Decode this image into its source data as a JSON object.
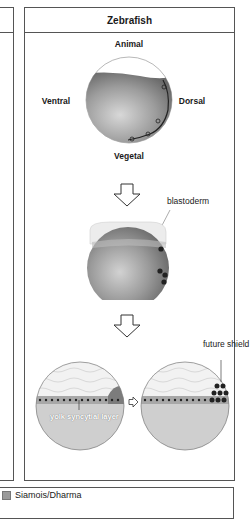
{
  "panel": {
    "title": "Zebrafish"
  },
  "stage1": {
    "labels": {
      "animal": "Animal",
      "vegetal": "Vegetal",
      "ventral": "Ventral",
      "dorsal": "Dorsal"
    }
  },
  "stage2": {
    "labels": {
      "blastoderm": "blastoderm"
    }
  },
  "stage3": {
    "labels": {
      "ysl": "yolk syncytial layer",
      "future_shield": "future shield"
    }
  },
  "legend": {
    "items": [
      {
        "label": "Siamois/Dharma",
        "color": "#9a9a9a"
      }
    ]
  },
  "colors": {
    "border": "#555555",
    "yolk_dark": "#7a7a7a",
    "yolk_light": "#d9d9d9",
    "cell_dot": "#222222"
  }
}
